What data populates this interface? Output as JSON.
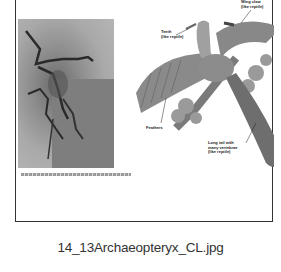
{
  "thumbnail": {
    "filename": "14_13Archaeopteryx_CL.jpg",
    "figure": {
      "photo_description": "Archaeopteryx fossil photograph",
      "illustration_description": "Archaeopteryx reconstruction perched on ginkgo branch",
      "labels": [
        {
          "text": "Wing claw\n(like reptile)"
        },
        {
          "text": "Teeth\n(like reptile)"
        },
        {
          "text": "Feathers"
        },
        {
          "text": "Long tail with\nmany vertebrae\n(like reptile)"
        }
      ]
    },
    "colors": {
      "border": "#333333",
      "caption": "#333333",
      "background": "#ffffff"
    }
  }
}
